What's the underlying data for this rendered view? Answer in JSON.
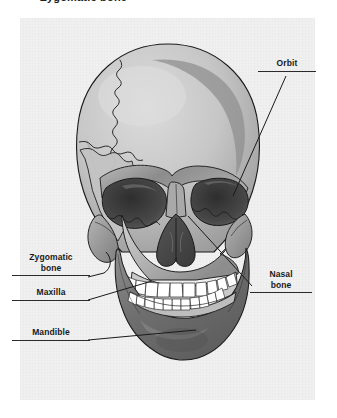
{
  "figure": {
    "caption": "Zygomatic bone",
    "panel_background": "#f0f0f0",
    "illustration": "human-skull-anterior-view"
  },
  "labels": {
    "orbit": {
      "text": "Orbit"
    },
    "zygomatic": {
      "line1": "Zygomatic",
      "line2": "bone"
    },
    "maxilla": {
      "text": "Maxilla"
    },
    "mandible": {
      "text": "Mandible"
    },
    "nasal": {
      "line1": "Nasal",
      "line2": "bone"
    }
  },
  "colors": {
    "outline": "#1a1a1a",
    "bone_light": "#d8d8d8",
    "bone_mid": "#b5b5b5",
    "bone_shadow": "#8f8f8f",
    "bone_dark": "#6b6b6b",
    "cavity": "#3c3c3c",
    "teeth": "#ffffff",
    "leader": "#1a1a1a"
  }
}
